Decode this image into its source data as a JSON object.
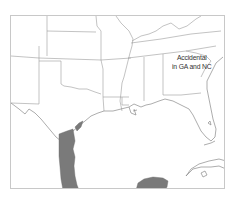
{
  "map": {
    "region": "Southern United States, Gulf of Mexico, northern Mexico and Yucatan",
    "annotation": {
      "line1": "Accidental",
      "line2": "in GA and NC"
    },
    "legend_colors": {
      "range": "#7a7a7a",
      "borders": "#9a9a9a",
      "frame": "#c8c8c8",
      "background": "#ffffff"
    },
    "shaded_areas": [
      "Texas Gulf coast and eastern Mexico coast",
      "Yucatan Peninsula"
    ]
  }
}
